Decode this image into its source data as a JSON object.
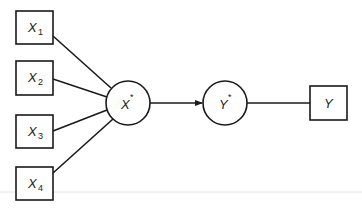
{
  "diagram": {
    "type": "path-model",
    "indicators": [
      {
        "id": "x1",
        "label": "X",
        "subscript": "1"
      },
      {
        "id": "x2",
        "label": "X",
        "subscript": "2"
      },
      {
        "id": "x3",
        "label": "X",
        "subscript": "3"
      },
      {
        "id": "x4",
        "label": "X",
        "subscript": "4"
      }
    ],
    "latent_x": {
      "label": "X",
      "superscript": "*"
    },
    "latent_y": {
      "label": "Y",
      "superscript": "*"
    },
    "outcome": {
      "label": "Y"
    },
    "edges": [
      {
        "from": "X1",
        "to": "X*",
        "directed": false
      },
      {
        "from": "X2",
        "to": "X*",
        "directed": false
      },
      {
        "from": "X3",
        "to": "X*",
        "directed": false
      },
      {
        "from": "X4",
        "to": "X*",
        "directed": false
      },
      {
        "from": "X*",
        "to": "Y*",
        "directed": true
      },
      {
        "from": "Y*",
        "to": "Y",
        "directed": false
      }
    ],
    "colors": {
      "stroke": "#1a1a1a",
      "background": "#ffffff"
    }
  }
}
